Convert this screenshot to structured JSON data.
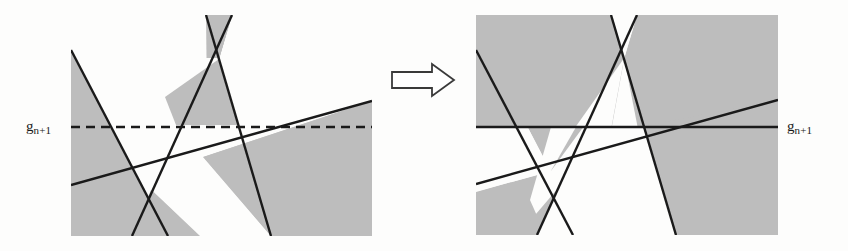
{
  "canvas": {
    "width": 848,
    "height": 251,
    "background": "#fdfdfc"
  },
  "style": {
    "shade_fill": "#bdbdbd",
    "line_color": "#1a1a1a",
    "line_width": 2.4,
    "dash_pattern": "9,6",
    "arrow_stroke": "#3a3a3a"
  },
  "labels": {
    "left_base": "g",
    "left_sub": "n+1",
    "right_base": "g",
    "right_sub": "n+1"
  },
  "figures": {
    "left": {
      "name": "before-figure",
      "bounds": {
        "x": 71,
        "y": 15,
        "width": 301,
        "height": 221
      },
      "level_line": {
        "y": 127,
        "style": "dashed",
        "x1": 71,
        "x2": 372
      },
      "lines": [
        {
          "name": "steep-descending-line",
          "x1": 71,
          "y1": 50,
          "x2": 168,
          "y2": 236
        },
        {
          "name": "left-rising-line",
          "x1": 132,
          "y1": 236,
          "x2": 232,
          "y2": 15
        },
        {
          "name": "right-descending-line",
          "x1": 206,
          "y1": 15,
          "x2": 271,
          "y2": 236
        },
        {
          "name": "shallow-rising-line",
          "x1": 71,
          "y1": 185,
          "x2": 372,
          "y2": 101
        }
      ]
    },
    "right": {
      "name": "after-figure",
      "bounds": {
        "x": 476,
        "y": 15,
        "width": 302,
        "height": 220
      },
      "level_line": {
        "y": 127,
        "style": "solid",
        "x1": 476,
        "x2": 778
      },
      "lines": [
        {
          "name": "steep-descending-line",
          "x1": 476,
          "y1": 50,
          "x2": 573,
          "y2": 235
        },
        {
          "name": "left-rising-line",
          "x1": 537,
          "y1": 235,
          "x2": 637,
          "y2": 15
        },
        {
          "name": "right-descending-line",
          "x1": 611,
          "y1": 15,
          "x2": 676,
          "y2": 235
        },
        {
          "name": "shallow-rising-line",
          "x1": 476,
          "y1": 184,
          "x2": 778,
          "y2": 100
        }
      ]
    }
  },
  "arrow": {
    "name": "transform-arrow",
    "direction": "right",
    "x": 392,
    "y": 64,
    "width": 62,
    "height": 32
  }
}
